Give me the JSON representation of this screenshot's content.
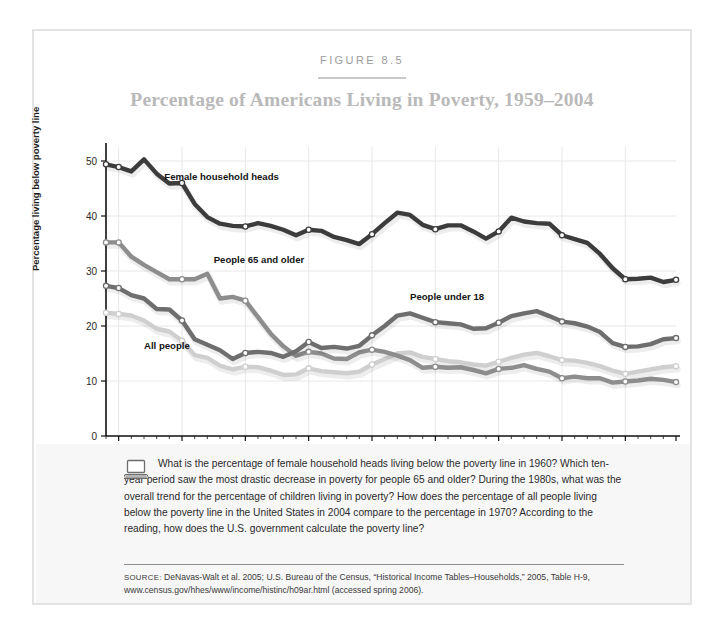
{
  "figure": {
    "number": "FIGURE 8.5",
    "title": "Percentage of Americans Living in Poverty, 1959–2004"
  },
  "caption": {
    "icon": "laptop-icon",
    "text": "What is the percentage of female household heads living below the poverty line in 1960? Which ten-year period saw the most drastic decrease in poverty for people 65 and older? During the 1980s, what was the overall trend for the percentage of children living in poverty? How does the percentage of all people living below the poverty line in the United States in 2004 compare to the percentage in 1970? According to the reading, how does the U.S. government calculate the poverty line?"
  },
  "source": {
    "label": "SOURCE:",
    "text": " DeNavas-Walt et al. 2005; U.S. Bureau of the Census, “Historical Income Tables–Households,” 2005, Table H-9, www.census.gov/hhes/www/income/histinc/h09ar.html (accessed spring 2006)."
  },
  "chart_data": {
    "type": "line",
    "title": "Percentage of Americans Living in Poverty, 1959–2004",
    "xlabel": "",
    "ylabel": "Percentage living below poverty line",
    "xlim": [
      1959,
      2004
    ],
    "ylim": [
      0,
      50
    ],
    "yticks": [
      0,
      10,
      20,
      30,
      40,
      50
    ],
    "xticks": [
      1960,
      1965,
      1970,
      1975,
      1980,
      1985,
      1990,
      1995,
      2000,
      2004
    ],
    "grid": true,
    "legend_position": "inline-labels",
    "x": [
      1959,
      1960,
      1961,
      1962,
      1963,
      1964,
      1965,
      1966,
      1967,
      1968,
      1969,
      1970,
      1971,
      1972,
      1973,
      1974,
      1975,
      1976,
      1977,
      1978,
      1979,
      1980,
      1981,
      1982,
      1983,
      1984,
      1985,
      1986,
      1987,
      1988,
      1989,
      1990,
      1991,
      1992,
      1993,
      1994,
      1995,
      1996,
      1997,
      1998,
      1999,
      2000,
      2001,
      2002,
      2003,
      2004
    ],
    "series": [
      {
        "name": "Female household heads",
        "color": "#3c3c3c",
        "label_x": 1963.6,
        "label_y": 46.6,
        "values": [
          49.4,
          48.9,
          48.1,
          50.3,
          47.7,
          45.9,
          46.0,
          42.2,
          39.8,
          38.6,
          38.2,
          38.1,
          38.7,
          38.2,
          37.5,
          36.5,
          37.5,
          37.3,
          36.2,
          35.6,
          34.9,
          36.7,
          38.7,
          40.6,
          40.2,
          38.4,
          37.6,
          38.3,
          38.3,
          37.2,
          35.9,
          37.2,
          39.7,
          39.0,
          38.7,
          38.6,
          36.5,
          35.8,
          35.1,
          33.1,
          30.5,
          28.5,
          28.6,
          28.8,
          28.0,
          28.4
        ]
      },
      {
        "name": "People 65 and older",
        "color": "#8d8d8d",
        "label_x": 1967.5,
        "label_y": 31.5,
        "values": [
          35.2,
          35.2,
          32.6,
          31.1,
          29.8,
          28.5,
          28.5,
          28.5,
          29.5,
          25.0,
          25.3,
          24.6,
          21.6,
          18.6,
          16.3,
          14.6,
          15.3,
          15.0,
          14.1,
          14.0,
          15.2,
          15.7,
          15.3,
          14.6,
          13.8,
          12.4,
          12.6,
          12.4,
          12.5,
          12.0,
          11.4,
          12.2,
          12.4,
          12.9,
          12.2,
          11.7,
          10.5,
          10.8,
          10.5,
          10.5,
          9.7,
          9.9,
          10.1,
          10.4,
          10.2,
          9.8
        ]
      },
      {
        "name": "People under 18",
        "color": "#6e6e6e",
        "label_x": 1983.0,
        "label_y": 24.7,
        "values": [
          27.3,
          26.9,
          25.6,
          25.0,
          23.1,
          23.0,
          21.0,
          17.6,
          16.6,
          15.6,
          14.0,
          15.1,
          15.3,
          15.1,
          14.4,
          15.4,
          17.1,
          16.0,
          16.2,
          15.9,
          16.4,
          18.3,
          20.0,
          21.9,
          22.3,
          21.5,
          20.7,
          20.5,
          20.3,
          19.5,
          19.6,
          20.6,
          21.8,
          22.3,
          22.7,
          21.8,
          20.8,
          20.5,
          19.9,
          18.9,
          16.9,
          16.2,
          16.3,
          16.7,
          17.6,
          17.8
        ]
      },
      {
        "name": "All people",
        "color": "#cfcfcf",
        "label_x": 1962.0,
        "label_y": 15.9,
        "values": [
          22.4,
          22.2,
          21.9,
          21.0,
          19.5,
          19.0,
          17.3,
          14.7,
          14.2,
          12.8,
          12.1,
          12.6,
          12.5,
          11.9,
          11.1,
          11.2,
          12.3,
          11.8,
          11.6,
          11.4,
          11.7,
          13.0,
          14.0,
          15.0,
          15.2,
          14.4,
          14.0,
          13.6,
          13.4,
          13.0,
          12.8,
          13.5,
          14.2,
          14.8,
          15.1,
          14.5,
          13.8,
          13.7,
          13.3,
          12.7,
          11.9,
          11.3,
          11.7,
          12.1,
          12.5,
          12.7
        ]
      }
    ]
  }
}
